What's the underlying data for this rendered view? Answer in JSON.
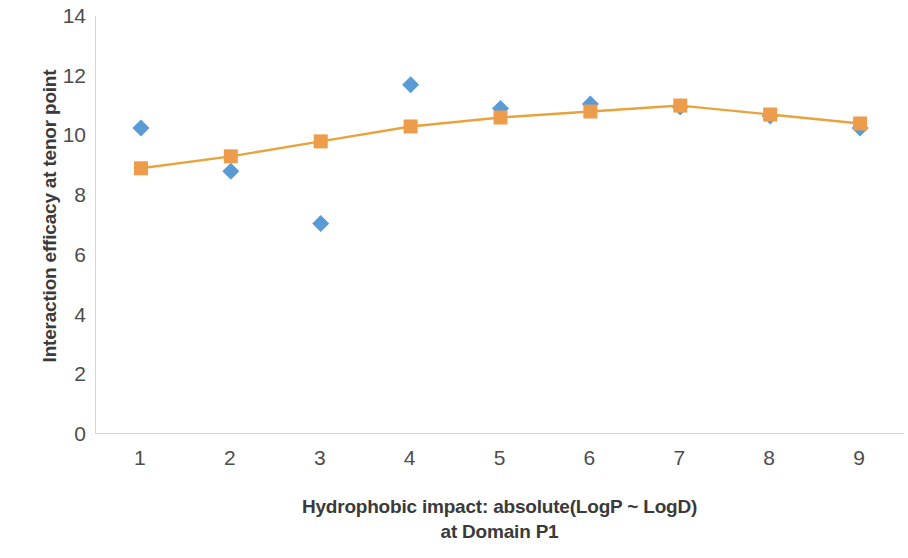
{
  "chart_data": {
    "type": "scatter",
    "title": "",
    "subtitle": "",
    "xlabel": "Hydrophobic impact: absolute(LogP ~ LogD) at Domain P1",
    "xlabel_line1": "Hydrophobic impact: absolute(LogP ~ LogD)",
    "xlabel_line2": "at Domain P1",
    "ylabel": "Interaction efficacy at tenor point",
    "x": [
      1,
      2,
      3,
      4,
      5,
      6,
      7,
      8,
      9
    ],
    "categories": [
      "1",
      "2",
      "3",
      "4",
      "5",
      "6",
      "7",
      "8",
      "9"
    ],
    "xlim": [
      0.5,
      9.5
    ],
    "ylim": [
      0,
      14
    ],
    "y_ticks": [
      0,
      2,
      4,
      6,
      8,
      10,
      12,
      14
    ],
    "y_tick_labels": [
      "0",
      "2",
      "4",
      "6",
      "8",
      "10",
      "12",
      "14"
    ],
    "x_tick_labels": [
      "1",
      "2",
      "3",
      "4",
      "5",
      "6",
      "7",
      "8",
      "9"
    ],
    "grid": false,
    "legend": "none",
    "series": [
      {
        "name": "observed",
        "marker": "diamond",
        "color": "#5B9BD5",
        "line": false,
        "values": [
          10.25,
          8.8,
          7.05,
          11.7,
          10.9,
          11.05,
          10.95,
          10.65,
          10.25
        ]
      },
      {
        "name": "fitted",
        "marker": "square",
        "color": "#ED9C4C",
        "line": true,
        "line_color": "#E8A33D",
        "values": [
          8.9,
          9.3,
          9.8,
          10.3,
          10.6,
          10.8,
          11.0,
          10.7,
          10.4
        ]
      }
    ],
    "axis_color": "#d6d6d6",
    "text_color": "#4d4d4d",
    "background": "#ffffff"
  }
}
